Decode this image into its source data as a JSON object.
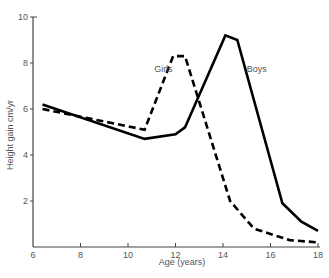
{
  "chart_data": {
    "type": "line",
    "title": "",
    "xlabel": "Age (years)",
    "ylabel": "Height gain cm/yr",
    "xlim": [
      6,
      18
    ],
    "ylim": [
      0,
      10
    ],
    "x_ticks": [
      "6",
      "8",
      "10",
      "12",
      "14",
      "16",
      "18"
    ],
    "y_ticks": [
      "2",
      "4",
      "6",
      "8",
      "10"
    ],
    "grid": false,
    "legend": "inline labels",
    "series": [
      {
        "name": "Boys",
        "style": "solid",
        "x": [
          6.4,
          10.7,
          12.0,
          12.4,
          14.1,
          14.6,
          16.5,
          17.3,
          18.0
        ],
        "values": [
          6.2,
          4.7,
          4.9,
          5.2,
          9.2,
          9.0,
          1.9,
          1.1,
          0.7
        ]
      },
      {
        "name": "Girls",
        "style": "dashed",
        "x": [
          6.4,
          10.7,
          11.9,
          12.4,
          14.3,
          15.3,
          16.8,
          18.0
        ],
        "values": [
          6.0,
          5.1,
          8.3,
          8.3,
          2.0,
          0.8,
          0.3,
          0.2
        ]
      }
    ],
    "annotations": [
      {
        "text": "Girls",
        "x": 11.1,
        "y": 7.6
      },
      {
        "text": "Boys",
        "x": 15.0,
        "y": 7.6
      }
    ]
  }
}
